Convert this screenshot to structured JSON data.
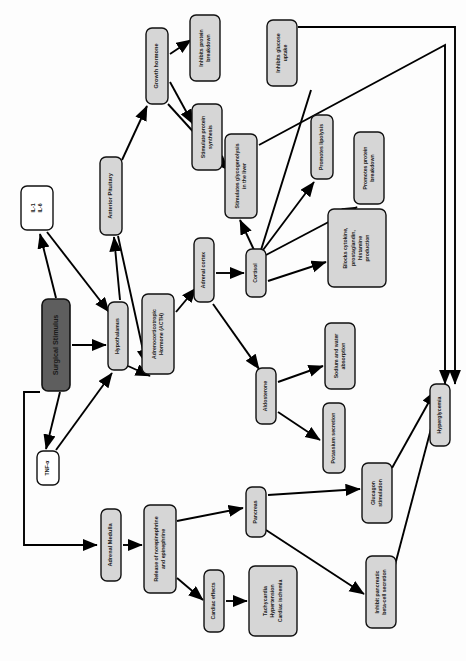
{
  "diagram": {
    "orientation": "rotated-90-clockwise",
    "colors": {
      "page_background": "#fdfdfd",
      "node_fill_light": "#d6d6d6",
      "node_fill_white": "#ffffff",
      "node_fill_dark": "#5e5e5e",
      "node_stroke": "#111111",
      "node_text": "#1a1a1a",
      "node_text_inverse": "#ffffff",
      "arrow": "#000000"
    },
    "nodes": [
      {
        "id": "surgical_stimulus",
        "label": "Surgical Stimulus",
        "lines": [
          "Surgical Stimulus"
        ],
        "fill": "dark",
        "x": 56,
        "y": 345,
        "w": 28,
        "h": 92
      },
      {
        "id": "interleukins",
        "label": "IL-1    IL-6",
        "lines": [
          "IL-1",
          "IL-6"
        ],
        "fill": "white",
        "x": 37,
        "y": 208,
        "w": 32,
        "h": 44
      },
      {
        "id": "tnf_alpha",
        "label": "TNF-α",
        "lines": [
          "TNF-α"
        ],
        "fill": "white",
        "x": 48,
        "y": 468,
        "w": 22,
        "h": 34
      },
      {
        "id": "hypothalamus",
        "label": "Hypothalamus",
        "lines": [
          "Hypothalamus"
        ],
        "fill": "light",
        "x": 118,
        "y": 336,
        "w": 20,
        "h": 68
      },
      {
        "id": "anterior_pituitary",
        "label": "Anterior Pituitary",
        "lines": [
          "Anterior Pituitary"
        ],
        "fill": "light",
        "x": 111,
        "y": 196,
        "w": 22,
        "h": 78
      },
      {
        "id": "acth",
        "label": "Adrenocorticotropic Hormone (ACTH)",
        "lines": [
          "Adrenocorticotropic",
          "Hormone (ACTH)"
        ],
        "fill": "light",
        "x": 158,
        "y": 334,
        "w": 32,
        "h": 80
      },
      {
        "id": "growth_hormone",
        "label": "Growth hormone",
        "lines": [
          "Growth hormone"
        ],
        "fill": "light",
        "x": 157,
        "y": 66,
        "w": 22,
        "h": 76
      },
      {
        "id": "inhibits_protein_breakdown",
        "label": "Inhibits protein breakdown",
        "lines": [
          "Inhibits protein",
          "breakdown"
        ],
        "fill": "light",
        "x": 205,
        "y": 48,
        "w": 30,
        "h": 66
      },
      {
        "id": "stimulate_protein_synthesis",
        "label": "Stimulate protein synthesis",
        "lines": [
          "Stimulate protein",
          "synthesis"
        ],
        "fill": "light",
        "x": 207,
        "y": 137,
        "w": 30,
        "h": 66
      },
      {
        "id": "stimulates_glycogenolysis",
        "label": "Stimulates glycogenolysis in the liver",
        "lines": [
          "Stimulates glycogenolysis",
          "in the liver"
        ],
        "fill": "light",
        "x": 241,
        "y": 176,
        "w": 32,
        "h": 84
      },
      {
        "id": "adrenal_cortex",
        "label": "Adrenal cortex",
        "lines": [
          "Adrenal cortex"
        ],
        "fill": "light",
        "x": 204,
        "y": 270,
        "w": 20,
        "h": 64
      },
      {
        "id": "cortisol",
        "label": "Cortisol",
        "lines": [
          "Cortisol"
        ],
        "fill": "light",
        "x": 256,
        "y": 273,
        "w": 20,
        "h": 48
      },
      {
        "id": "inhibits_glucose_uptake",
        "label": "Inhibits glucose uptake",
        "lines": [
          "Inhibits glucose",
          "uptake"
        ],
        "fill": "light",
        "x": 282,
        "y": 53,
        "w": 30,
        "h": 66
      },
      {
        "id": "promotes_lipolysis",
        "label": "Promotes lipolysis",
        "lines": [
          "Promotes lipolysis"
        ],
        "fill": "light",
        "x": 322,
        "y": 147,
        "w": 22,
        "h": 64
      },
      {
        "id": "promotes_protein_breakdown",
        "label": "Promotes protein breakdown",
        "lines": [
          "Promotes protein",
          "breakdown"
        ],
        "fill": "light",
        "x": 369,
        "y": 168,
        "w": 30,
        "h": 72
      },
      {
        "id": "blocks_cytokine",
        "label": "Blocks cytokine, prostaglandin, histamine production",
        "lines": [
          "Blocks cytokine,",
          "prostaglandin,",
          "histamine",
          "production"
        ],
        "fill": "light",
        "x": 357,
        "y": 248,
        "w": 58,
        "h": 78
      },
      {
        "id": "aldosterone",
        "label": "Aldosterone",
        "lines": [
          "Aldosterone"
        ],
        "fill": "light",
        "x": 266,
        "y": 396,
        "w": 20,
        "h": 56
      },
      {
        "id": "sodium_water",
        "label": "Sodium and water absorption",
        "lines": [
          "Sodium and water",
          "absorption"
        ],
        "fill": "light",
        "x": 340,
        "y": 356,
        "w": 30,
        "h": 66
      },
      {
        "id": "potassium_secretion",
        "label": "Potassium secretion",
        "lines": [
          "Potassium secretion"
        ],
        "fill": "light",
        "x": 334,
        "y": 438,
        "w": 22,
        "h": 70
      },
      {
        "id": "adrenal_medulla",
        "label": "Adrenal Medulla",
        "lines": [
          "Adrenal Medulla"
        ],
        "fill": "light",
        "x": 111,
        "y": 545,
        "w": 20,
        "h": 72
      },
      {
        "id": "release_ne_epi",
        "label": "Release of norepinephrine and epinephrine",
        "lines": [
          "Release of norepinephrine",
          "and epinephrine"
        ],
        "fill": "light",
        "x": 160,
        "y": 549,
        "w": 32,
        "h": 88
      },
      {
        "id": "cardiac_effects",
        "label": "Cardiac effects",
        "lines": [
          "Cardiac effects"
        ],
        "fill": "light",
        "x": 214,
        "y": 601,
        "w": 20,
        "h": 62
      },
      {
        "id": "cardiac_outcomes",
        "label": "Tachycardia Hypertension Cardiac ischemia",
        "lines": [
          "Tachycardia",
          "Hypertension",
          "Cardiac ischemia"
        ],
        "fill": "light",
        "x": 273,
        "y": 601,
        "w": 48,
        "h": 70
      },
      {
        "id": "pancreas",
        "label": "Pancreas",
        "lines": [
          "Pancreas"
        ],
        "fill": "light",
        "x": 256,
        "y": 512,
        "w": 20,
        "h": 50
      },
      {
        "id": "glucagon_stimulation",
        "label": "Glucagon stimulation",
        "lines": [
          "Glucagon",
          "stimulation"
        ],
        "fill": "light",
        "x": 377,
        "y": 493,
        "w": 30,
        "h": 60
      },
      {
        "id": "inhibit_beta_cell",
        "label": "Inhibit pancreatic beta-cell secretion",
        "lines": [
          "Inhibit pancreatic",
          "beta-cell secretion"
        ],
        "fill": "light",
        "x": 381,
        "y": 592,
        "w": 30,
        "h": 72
      },
      {
        "id": "hyperglycemia",
        "label": "Hyperglycemia",
        "lines": [
          "Hyperglycemia"
        ],
        "fill": "light",
        "x": 440,
        "y": 415,
        "w": 20,
        "h": 62
      }
    ],
    "edges": [
      {
        "from": "surgical_stimulus",
        "to": "hypothalamus",
        "path": "M 72,345 L 106,345",
        "arrow": true
      },
      {
        "from": "surgical_stimulus",
        "to": "interleukins",
        "path": "M 56,298 L 40,234",
        "arrow": true
      },
      {
        "from": "surgical_stimulus",
        "to": "tnf_alpha",
        "path": "M 60,392 L 46,449",
        "arrow": true
      },
      {
        "from": "interleukins",
        "to": "hypothalamus",
        "path": "M 47,232 L 109,312",
        "arrow": true
      },
      {
        "from": "tnf_alpha",
        "to": "hypothalamus",
        "path": "M 56,450 L 112,373",
        "arrow": true
      },
      {
        "from": "hypothalamus",
        "to": "anterior_pituitary",
        "path": "M 120,300 L 114,237",
        "arrow": true
      },
      {
        "from": "hypothalamus",
        "to": "acth",
        "path": "M 128,366 L 150,376",
        "arrow": true
      },
      {
        "from": "anterior_pituitary",
        "to": "growth_hormone",
        "path": "M 122,160 L 147,106",
        "arrow": true
      },
      {
        "from": "anterior_pituitary",
        "to": "acth",
        "path": "M 118,236 L 146,364",
        "arrow": true
      },
      {
        "from": "growth_hormone",
        "to": "inhibits_protein_breakdown",
        "path": "M 170,54 L 191,40",
        "arrow": true
      },
      {
        "from": "growth_hormone",
        "to": "stimulate_protein_synthesis",
        "path": "M 170,82 L 193,124",
        "arrow": true
      },
      {
        "from": "growth_hormone",
        "to": "stimulates_glycogenolysis",
        "path": "M 168,104 L 228,170",
        "arrow": true
      },
      {
        "from": "acth",
        "to": "adrenal_cortex",
        "path": "M 176,312 L 196,288",
        "arrow": true
      },
      {
        "from": "adrenal_cortex",
        "to": "cortisol",
        "path": "M 216,273 L 244,273",
        "arrow": true
      },
      {
        "from": "adrenal_cortex",
        "to": "aldosterone",
        "path": "M 213,304 L 259,369",
        "arrow": true
      },
      {
        "from": "cortisol",
        "to": "stimulates_glycogenolysis",
        "path": "M 254,250 L 240,220",
        "arrow": true
      },
      {
        "from": "cortisol",
        "to": "inhibits_glucose_uptake",
        "path": "M 261,250 L 311,90",
        "arrow": false
      },
      {
        "from": "cortisol",
        "to": "promotes_lipolysis",
        "path": "M 263,250 L 314,182",
        "arrow": true
      },
      {
        "from": "cortisol",
        "to": "promotes_protein_breakdown",
        "path": "M 266,255 L 357,207",
        "arrow": true
      },
      {
        "from": "cortisol",
        "to": "blocks_cytokine",
        "path": "M 268,281 L 326,262",
        "arrow": true
      },
      {
        "from": "aldosterone",
        "to": "sodium_water",
        "path": "M 278,382 L 323,366",
        "arrow": true
      },
      {
        "from": "aldosterone",
        "to": "potassium_secretion",
        "path": "M 278,412 L 320,440",
        "arrow": true
      },
      {
        "from": "surgical_stimulus",
        "to": "adrenal_medulla",
        "path": "M 40,392 L 24,392 L 24,545 L 97,545",
        "arrow": true
      },
      {
        "from": "adrenal_medulla",
        "to": "release_ne_epi",
        "path": "M 123,545 L 142,545",
        "arrow": true
      },
      {
        "from": "release_ne_epi",
        "to": "pancreas",
        "path": "M 177,521 L 243,508",
        "arrow": true
      },
      {
        "from": "release_ne_epi",
        "to": "cardiac_effects",
        "path": "M 177,578 L 203,600",
        "arrow": true
      },
      {
        "from": "cardiac_effects",
        "to": "cardiac_outcomes",
        "path": "M 226,601 L 247,601",
        "arrow": true
      },
      {
        "from": "pancreas",
        "to": "glucagon_stimulation",
        "path": "M 268,495 L 360,489",
        "arrow": true
      },
      {
        "from": "pancreas",
        "to": "inhibit_beta_cell",
        "path": "M 266,530 L 364,594",
        "arrow": true
      },
      {
        "from": "glucagon_stimulation",
        "to": "hyperglycemia",
        "path": "M 392,468 L 435,391",
        "arrow": true
      },
      {
        "from": "inhibit_beta_cell",
        "to": "hyperglycemia",
        "path": "M 395,565 L 441,391",
        "arrow": true
      },
      {
        "from": "inhibits_glucose_uptake",
        "to": "hyperglycemia",
        "path": "M 298,27 L 455,27 L 455,384",
        "arrow": true
      },
      {
        "from": "stimulates_glycogenolysis",
        "to": "hyperglycemia",
        "path": "M 259,145 L 445,45 L 445,384",
        "arrow": true
      }
    ]
  }
}
